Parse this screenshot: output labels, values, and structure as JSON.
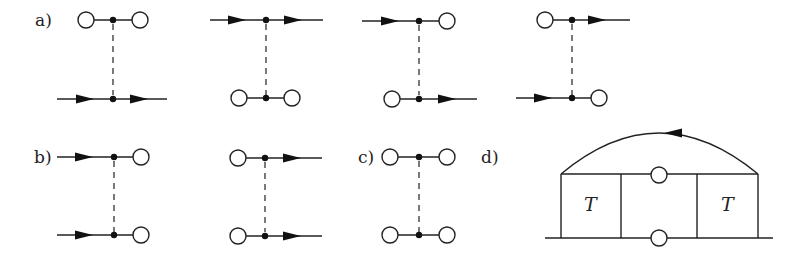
{
  "figure": {
    "panel_labels": {
      "a": "a)",
      "b": "b)",
      "c": "c)",
      "d": "d)"
    },
    "box_labels": {
      "left": "T",
      "right": "T"
    },
    "legend_semantics": {
      "open_circle": "external vertex / endpoint",
      "filled_dot": "interaction vertex",
      "arrow_line": "directed propagator",
      "dashed_line": "interaction"
    },
    "panels": [
      {
        "id": "a1",
        "top": "circle-dot-circle",
        "bottom": "arrow-dot-arrow"
      },
      {
        "id": "a2",
        "top": "arrow-dot-arrow",
        "bottom": "circle-dot-circle"
      },
      {
        "id": "a3",
        "top": "arrow-dot-circle",
        "bottom": "circle-dot-arrow"
      },
      {
        "id": "a4",
        "top": "circle-dot-arrow",
        "bottom": "arrow-dot-circle"
      },
      {
        "id": "b1",
        "top": "arrow-dot-circle",
        "bottom": "arrow-dot-circle"
      },
      {
        "id": "b2",
        "top": "circle-dot-arrow",
        "bottom": "circle-dot-arrow"
      },
      {
        "id": "c1",
        "top": "circle-dot-circle",
        "bottom": "circle-dot-circle"
      },
      {
        "id": "d1",
        "description": "two T boxes joined by lines with circles, arc on top with leftward arrow"
      }
    ]
  }
}
